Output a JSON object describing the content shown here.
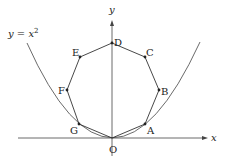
{
  "diagram": {
    "curve_label": "y = x²",
    "curve_label_parts": {
      "lhs": "y",
      "eq": " = ",
      "var": "x",
      "exp": "2"
    },
    "axes": {
      "x_label": "x",
      "y_label": "y",
      "origin_label": "O"
    },
    "vertices": [
      {
        "label": "A",
        "x": 145,
        "y": 124
      },
      {
        "label": "B",
        "x": 159,
        "y": 90
      },
      {
        "label": "C",
        "x": 145,
        "y": 57
      },
      {
        "label": "D",
        "x": 112,
        "y": 43
      },
      {
        "label": "E",
        "x": 80,
        "y": 57
      },
      {
        "label": "F",
        "x": 67,
        "y": 90
      },
      {
        "label": "G",
        "x": 79,
        "y": 124
      }
    ],
    "colors": {
      "line": "#333333",
      "background": "#ffffff"
    }
  }
}
